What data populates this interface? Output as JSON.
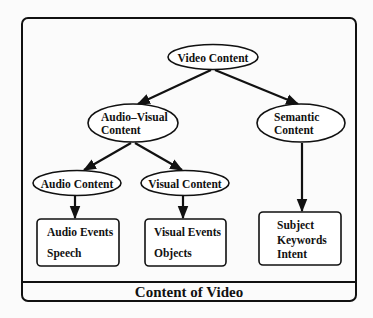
{
  "diagram": {
    "caption": "Content of Video",
    "nodes": {
      "video_content": {
        "lines": [
          "Video Content"
        ]
      },
      "audio_visual": {
        "lines": [
          "Audio–Visual",
          "Content"
        ]
      },
      "semantic": {
        "lines": [
          "Semantic",
          "Content"
        ]
      },
      "audio_content": {
        "lines": [
          "Audio Content"
        ]
      },
      "visual_content": {
        "lines": [
          "Visual Content"
        ]
      },
      "audio_box": {
        "lines": [
          "Audio Events",
          "Speech"
        ]
      },
      "visual_box": {
        "lines": [
          "Visual Events",
          "Objects"
        ]
      },
      "semantic_box": {
        "lines": [
          "Subject",
          "Keywords",
          "Intent"
        ]
      }
    },
    "edges": [
      {
        "from": "video_content",
        "to": "audio_visual"
      },
      {
        "from": "video_content",
        "to": "semantic"
      },
      {
        "from": "audio_visual",
        "to": "audio_content"
      },
      {
        "from": "audio_visual",
        "to": "visual_content"
      },
      {
        "from": "audio_content",
        "to": "audio_box"
      },
      {
        "from": "visual_content",
        "to": "visual_box"
      },
      {
        "from": "semantic",
        "to": "semantic_box"
      }
    ]
  }
}
